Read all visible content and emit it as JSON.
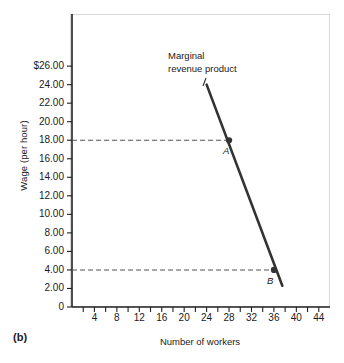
{
  "panel": {
    "tag": "(b)"
  },
  "chart_data": {
    "type": "line",
    "title": "",
    "xlabel": "Number of workers",
    "ylabel": "Wage (per hour)",
    "xlim": [
      0,
      46
    ],
    "ylim": [
      0,
      27.2
    ],
    "grid": false,
    "legend": "none",
    "series": [
      {
        "name": "Marginal revenue product",
        "x": [
          24.0,
          37.5
        ],
        "values": [
          24.0,
          2.3
        ],
        "color": "#333333"
      }
    ],
    "points": [
      {
        "label": "A",
        "x": 28,
        "y": 18
      },
      {
        "label": "B",
        "x": 36,
        "y": 4
      }
    ],
    "guide_lines": [
      {
        "type": "horizontal",
        "y": 18,
        "x_from": 0,
        "x_to": 28,
        "style": "dashed"
      },
      {
        "type": "horizontal",
        "y": 4,
        "x_from": 0,
        "x_to": 36,
        "style": "dashed"
      }
    ],
    "annotations": [
      {
        "name": "mrp-label",
        "line1": "Marginal",
        "line2": "revenue product"
      }
    ],
    "x_ticks": [
      0,
      2,
      4,
      6,
      8,
      10,
      12,
      14,
      16,
      18,
      20,
      22,
      24,
      26,
      28,
      30,
      32,
      34,
      36,
      38,
      40,
      42,
      44
    ],
    "x_tick_labels": [
      {
        "value": 4,
        "text": "4"
      },
      {
        "value": 8,
        "text": "8"
      },
      {
        "value": 12,
        "text": "12"
      },
      {
        "value": 16,
        "text": "16"
      },
      {
        "value": 20,
        "text": "20"
      },
      {
        "value": 24,
        "text": "24"
      },
      {
        "value": 28,
        "text": "28"
      },
      {
        "value": 32,
        "text": "32"
      },
      {
        "value": 36,
        "text": "36"
      },
      {
        "value": 40,
        "text": "40"
      },
      {
        "value": 44,
        "text": "44"
      }
    ],
    "y_ticks": [
      0,
      2,
      4,
      6,
      8,
      10,
      12,
      14,
      16,
      18,
      20,
      22,
      24,
      26
    ],
    "y_tick_labels": [
      {
        "value": 26,
        "text": "$26.00"
      },
      {
        "value": 24,
        "text": "24.00"
      },
      {
        "value": 22,
        "text": "22.00"
      },
      {
        "value": 20,
        "text": "20.00"
      },
      {
        "value": 18,
        "text": "18.00"
      },
      {
        "value": 16,
        "text": "16.00"
      },
      {
        "value": 14,
        "text": "14.00"
      },
      {
        "value": 12,
        "text": "12.00"
      },
      {
        "value": 10,
        "text": "10.00"
      },
      {
        "value": 8,
        "text": "8.00"
      },
      {
        "value": 6,
        "text": "6.00"
      },
      {
        "value": 4,
        "text": "4.00"
      },
      {
        "value": 2,
        "text": "2.00"
      },
      {
        "value": 0,
        "text": "0"
      }
    ],
    "colors": {
      "line": "#333333",
      "axis": "#222222",
      "guide": "#555555",
      "frame": "#d8d8d8",
      "text": "#1a1a1a"
    }
  }
}
